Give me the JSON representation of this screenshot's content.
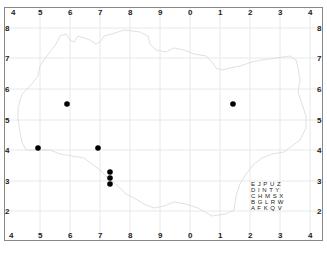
{
  "map": {
    "title": "",
    "grid": {
      "x_labels": [
        "4",
        "5",
        "6",
        "7",
        "8",
        "9",
        "0",
        "1",
        "2",
        "3",
        "4"
      ],
      "y_labels": [
        "8",
        "7",
        "6",
        "5",
        "4",
        "3",
        "2"
      ],
      "line_color": "#e6e6e6",
      "frame_color": "#888888"
    },
    "points": [
      {
        "x": 67,
        "y": 104
      },
      {
        "x": 233,
        "y": 104
      },
      {
        "x": 38,
        "y": 148
      },
      {
        "x": 98,
        "y": 148
      },
      {
        "x": 110,
        "y": 172
      },
      {
        "x": 110,
        "y": 178
      },
      {
        "x": 110,
        "y": 184
      }
    ],
    "point_color": "#000000",
    "legend": {
      "rows": [
        "E J P U Z",
        "D I N T Y",
        "C H M S X",
        "B G L R W",
        "A F K Q V"
      ]
    }
  }
}
